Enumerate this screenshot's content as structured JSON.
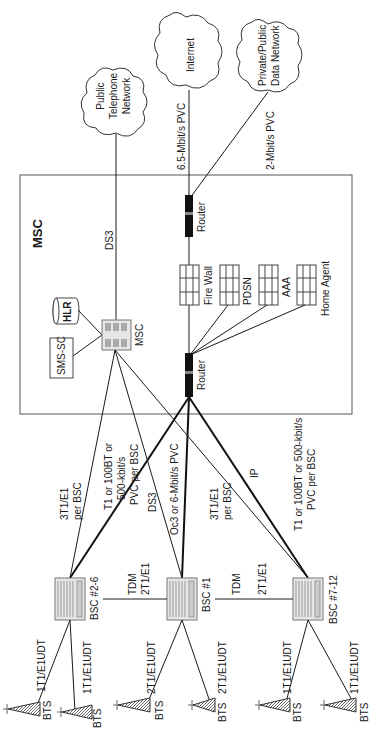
{
  "diagram": {
    "orientation": "rotated-90-ccw",
    "msc_box": {
      "title": "MSC"
    },
    "clouds": [
      {
        "id": "pstn",
        "lines": [
          "Public",
          "Telephone",
          "Network"
        ]
      },
      {
        "id": "internet",
        "lines": [
          "Internet"
        ]
      },
      {
        "id": "pdn",
        "lines": [
          "Private/Public",
          "Data Network"
        ]
      }
    ],
    "msc_components": {
      "hlr": "HLR",
      "sms_sc": "SMS-SC",
      "msc_switch": "MSC"
    },
    "routers": {
      "top": "Router",
      "bottom": "Router"
    },
    "servers": [
      {
        "id": "firewall",
        "label": "Fire Wall"
      },
      {
        "id": "pdsn",
        "label": "PDSN"
      },
      {
        "id": "aaa",
        "label": "AAA"
      },
      {
        "id": "home_agent",
        "label": "Home Agent"
      }
    ],
    "bscs": [
      {
        "id": "bsc2_6",
        "label": "BSC #2-6"
      },
      {
        "id": "bsc1",
        "label": "BSC #1"
      },
      {
        "id": "bsc7_12",
        "label": "BSC #7-12"
      }
    ],
    "bts_label": "BTS",
    "links": {
      "pstn_msc": "DS3",
      "internet_router": "6.5-Mbit/s PVC",
      "pdn_router": "2-Mbit/s PVC",
      "bsc2_6_msc": [
        "3T1/E1",
        "per BSC"
      ],
      "bsc2_6_router": [
        "T1 or 100BT or",
        "500-kbit/s",
        "PVC per BSC"
      ],
      "bsc1_msc": "DS3",
      "bsc1_router": "Oc3 or 6-Mbit/s PVC",
      "bsc7_12_msc": [
        "3T1/E1",
        "per BSC"
      ],
      "bsc7_12_router_ip": "IP",
      "bsc7_12_router": [
        "T1 or 100BT or 500-kbit/s",
        "PVC per BSC"
      ],
      "tdm_1": [
        "TDM",
        "2T1/E1"
      ],
      "tdm_2": [
        "TDM",
        "2T1/E1"
      ],
      "bts_bsc2_6_a": "1T1/E1UDT",
      "bts_bsc2_6_b": "1T1/E1UDT",
      "bts_bsc1_a": "2T1/E1UDT",
      "bts_bsc1_b": "2T1/E1UDT",
      "bts_bsc7_12_a": "1T1/E1UDT",
      "bts_bsc7_12_b": "1T1/E1UDT"
    }
  }
}
